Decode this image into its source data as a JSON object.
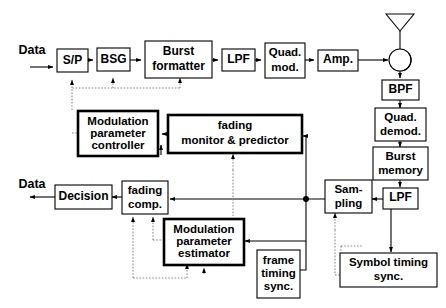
{
  "diagram": {
    "colors": {
      "line": "#000000",
      "dotted_line": "#8a8a8a",
      "box_fill": "#ffffff",
      "background": "#ffffff"
    },
    "labels": {
      "data_in": "Data",
      "data_out": "Data"
    },
    "boxes": {
      "sp": {
        "label": "S/P"
      },
      "bsg": {
        "label": "BSG"
      },
      "burst_formatter": {
        "line1": "Burst",
        "line2": "formatter"
      },
      "lpf_tx": {
        "label": "LPF"
      },
      "quad_mod": {
        "line1": "Quad.",
        "line2": "mod."
      },
      "amp": {
        "label": "Amp."
      },
      "bpf": {
        "label": "BPF"
      },
      "quad_demod": {
        "line1": "Quad.",
        "line2": "demod."
      },
      "burst_memory": {
        "line1": "Burst",
        "line2": "memory"
      },
      "lpf_rx": {
        "label": "LPF"
      },
      "sampling": {
        "line1": "Sam-",
        "line2": "pling"
      },
      "symbol_timing_sync": {
        "line1": "Symbol timing",
        "line2": "sync."
      },
      "frame_timing_sync": {
        "line1": "frame",
        "line2": "timing",
        "line3": "sync."
      },
      "modulation_parameter_controller": {
        "line1": "Modulation",
        "line2": "parameter",
        "line3": "controller"
      },
      "fading_monitor_predictor": {
        "line1": "fading",
        "line2": "monitor & predictor"
      },
      "modulation_parameter_estimator": {
        "line1": "Modulation",
        "line2": "parameter",
        "line3": "estimator"
      },
      "fading_comp": {
        "line1": "fading",
        "line2": "comp."
      },
      "decision": {
        "label": "Decision"
      }
    },
    "symbols": {
      "antenna": "antenna-icon",
      "circulator": "circulator-icon"
    }
  }
}
